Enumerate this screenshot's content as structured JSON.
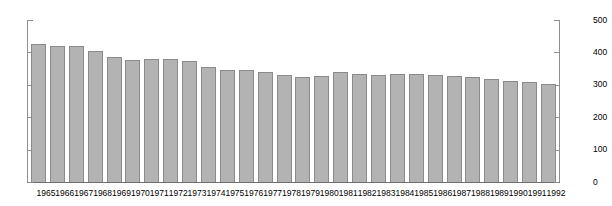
{
  "chart_data": {
    "type": "bar",
    "title": "",
    "xlabel": "",
    "ylabel": "",
    "ylim": [
      0,
      500
    ],
    "yticks": [
      0,
      100,
      200,
      300,
      400,
      500
    ],
    "grid": false,
    "legend": null,
    "axes": {
      "left_axis_labels": [
        "0",
        "100",
        "200",
        "300",
        "400",
        "500"
      ],
      "right_axis_labels": [
        "0",
        "100",
        "200",
        "300",
        "400",
        "500"
      ],
      "right_axis_mirrors_left": true
    },
    "bar_style": {
      "fill_color": "#b3b3b3",
      "edge_color": "#8a8a8a"
    },
    "categories": [
      "1965",
      "1966",
      "1967",
      "1968",
      "1969",
      "1970",
      "1971",
      "1972",
      "1973",
      "1974",
      "1975",
      "1976",
      "1977",
      "1978",
      "1979",
      "1980",
      "1981",
      "1982",
      "1983",
      "1984",
      "1985",
      "1986",
      "1987",
      "1988",
      "1989",
      "1990",
      "1991",
      "1992"
    ],
    "values": [
      425,
      420,
      420,
      403,
      387,
      378,
      380,
      381,
      373,
      355,
      346,
      347,
      339,
      331,
      324,
      328,
      341,
      334,
      329,
      334,
      334,
      330,
      327,
      323,
      318,
      312,
      308,
      303
    ]
  },
  "title_remnant": {
    "text": ""
  }
}
